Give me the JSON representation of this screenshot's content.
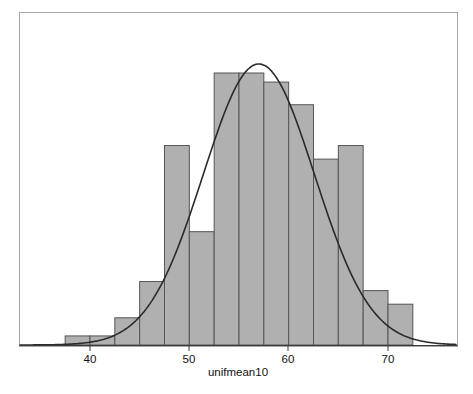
{
  "chart_data": {
    "type": "bar",
    "title": "",
    "subtitle": "",
    "xlabel": "unifmean10",
    "ylabel": "",
    "xlim": [
      35.0,
      75.0
    ],
    "ylim": [
      0,
      60
    ],
    "grid": false,
    "legend": false,
    "legend_position": "none",
    "xticks": [
      40,
      50,
      60,
      70
    ],
    "xtick_labels": [
      "40",
      "50",
      "60",
      "70"
    ],
    "yticks": [],
    "ytick_labels": [],
    "bin_width": 2.5,
    "bin_edges": [
      37.5,
      40.0,
      42.5,
      45.0,
      47.5,
      50.0,
      52.5,
      55.0,
      57.5,
      60.0,
      62.5,
      65.0,
      67.5,
      70.0,
      72.5
    ],
    "bin_centers": [
      38.75,
      41.25,
      43.75,
      46.25,
      48.75,
      51.25,
      53.75,
      56.25,
      58.75,
      61.25,
      63.75,
      66.25,
      68.75,
      71.25
    ],
    "categories": [
      "37.5-40",
      "40-42.5",
      "42.5-45",
      "45-47.5",
      "47.5-50",
      "50-52.5",
      "52.5-55",
      "55-57.5",
      "57.5-60",
      "60-62.5",
      "62.5-65",
      "65-67.5",
      "67.5-70",
      "70-72.5"
    ],
    "values": [
      2,
      2,
      6,
      14,
      44,
      25,
      60,
      60,
      58,
      53,
      41,
      44,
      12,
      9
    ],
    "bar_fill_color": "#b0b0b0",
    "bar_edge_color": "#555555",
    "curve_color": "#2b2b2b",
    "frame_color": "#a8a8a8",
    "background_color": "#ffffff",
    "overlay_curve": {
      "name": "normal density",
      "kind": "line",
      "mean": 57.0,
      "sd": 5.6,
      "peak_value": 62
    },
    "annotations": []
  },
  "axis": {
    "x_label": "unifmean10",
    "tick_40": "40",
    "tick_50": "50",
    "tick_60": "60",
    "tick_70": "70"
  }
}
